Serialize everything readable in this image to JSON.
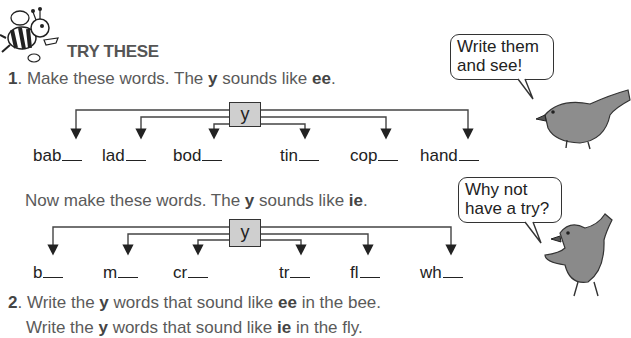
{
  "heading": "TRY THESE",
  "q1": {
    "number": "1",
    "pre": ". Make these words. The ",
    "y": "y",
    "mid": " sounds like ",
    "sound": "ee",
    "post": "."
  },
  "diagram1": {
    "center": "y",
    "words": [
      "bab",
      "lad",
      "bod",
      "tin",
      "cop",
      "hand"
    ]
  },
  "q1b": {
    "pre": "Now make these words. The ",
    "y": "y",
    "mid": " sounds like ",
    "sound": "ie",
    "post": "."
  },
  "diagram2": {
    "center": "y",
    "words": [
      "b",
      "m",
      "cr",
      "tr",
      "fl",
      "wh"
    ]
  },
  "q2": {
    "number": "2",
    "line1_pre": ". Write the ",
    "line1_y": "y",
    "line1_mid": " words that sound like ",
    "line1_sound": "ee",
    "line1_post": " in the bee.",
    "line2_pre": "Write the ",
    "line2_y": "y",
    "line2_mid": " words that sound like ",
    "line2_sound": "ie",
    "line2_post": " in the fly."
  },
  "bubbles": {
    "top_line1": "Write them",
    "top_line2": "and see!",
    "bottom_line1": "Why not",
    "bottom_line2": "have a try?"
  }
}
